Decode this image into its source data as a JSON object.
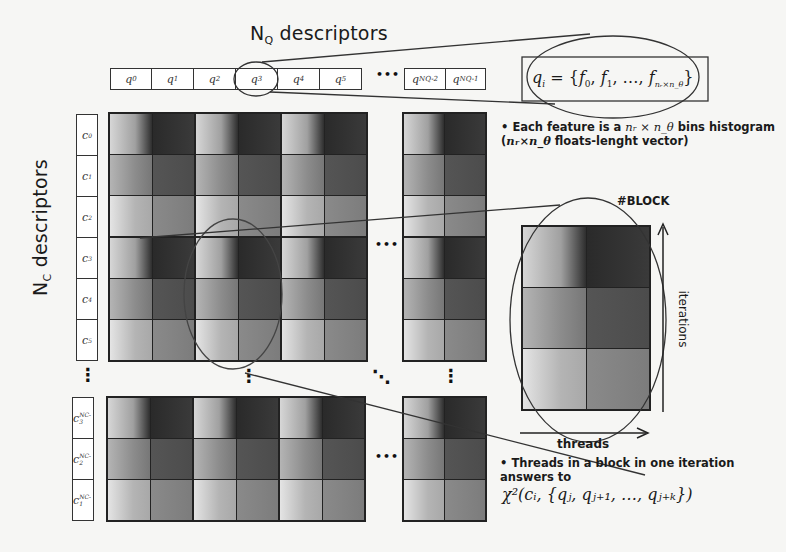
{
  "diagram": {
    "query_axis": {
      "title_main": "N",
      "title_sub": "Q",
      "title_rest": " descriptors",
      "items": [
        {
          "base": "q",
          "sub": "0"
        },
        {
          "base": "q",
          "sub": "1"
        },
        {
          "base": "q",
          "sub": "2"
        },
        {
          "base": "q",
          "sub": "3"
        },
        {
          "base": "q",
          "sub": "4"
        },
        {
          "base": "q",
          "sub": "5"
        },
        {
          "base": "q",
          "sub": "NQ-2"
        },
        {
          "base": "q",
          "sub": "NQ-1"
        }
      ],
      "ellipsis": "•••",
      "highlighted": "q3"
    },
    "candidate_axis": {
      "title_main": "N",
      "title_sub": "C",
      "title_rest": " descriptors",
      "items": [
        {
          "base": "c",
          "sub": "0"
        },
        {
          "base": "c",
          "sub": "1"
        },
        {
          "base": "c",
          "sub": "2"
        },
        {
          "base": "c",
          "sub": "3"
        },
        {
          "base": "c",
          "sub": "4"
        },
        {
          "base": "c",
          "sub": "5"
        },
        {
          "base": "c",
          "sub": "NC-3"
        },
        {
          "base": "c",
          "sub": "NC-2"
        },
        {
          "base": "c",
          "sub": "NC-1"
        }
      ],
      "ellipsis": "⋮"
    },
    "formula_box": "qᵢ = {f₀, f₁, …, f_{nᵣ×n_θ}}",
    "formula_parts": {
      "lhs": "q",
      "lhs_sub": "i",
      "eq": " = {",
      "f0": "f",
      "f0s": "0",
      ",": ", ",
      "f1": "f",
      "f1s": "1",
      "dots": ", …, ",
      "fn": "f",
      "fns": "nᵣ×n_θ",
      "close": "}"
    },
    "note1": {
      "bullet": "•",
      "line1_a": "Each feature is a ",
      "line1_math": "nᵣ × n_θ",
      "line1_b": " bins histogram",
      "line2_a": "(",
      "line2_math": "nᵣ×n_θ",
      "line2_b": " floats-lenght vector)"
    },
    "block_label": "#BLOCK",
    "iterations_label": "iterations",
    "threads_label": "threads",
    "note2": {
      "bullet": "•",
      "line1": "Threads in a block in one iteration",
      "line2": "answers to",
      "formula": "χ²(cᵢ, {qⱼ, qⱼ₊₁, …, qⱼ₊ₖ})"
    },
    "matrix": {
      "block_rows": 3,
      "block_cols": 4,
      "cell_grid": "2 columns × 3 rows per block",
      "ellipsis_horizontal": "•••",
      "ellipsis_vertical": "⋮",
      "ellipsis_diagonal": "⋱"
    }
  }
}
